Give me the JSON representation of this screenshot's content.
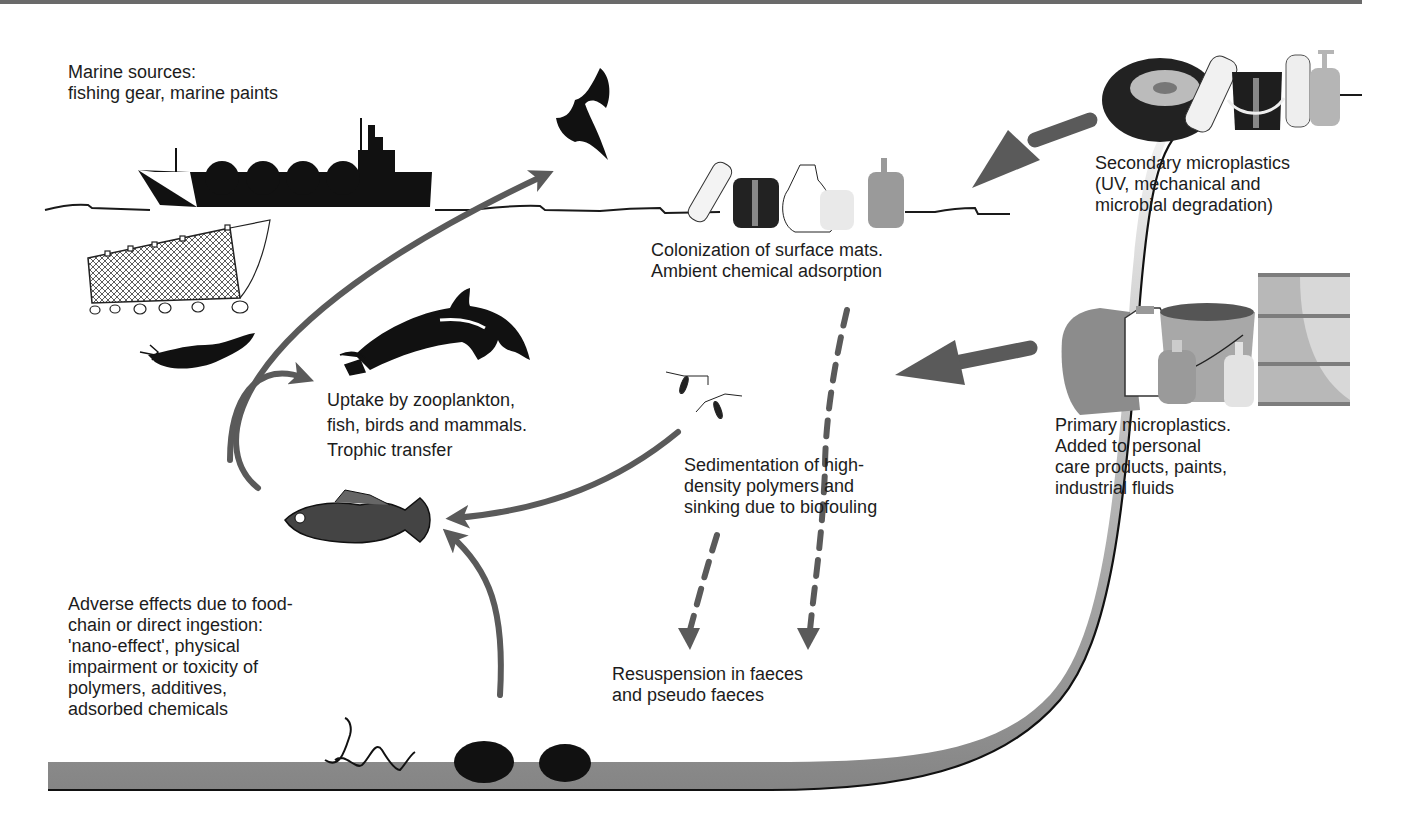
{
  "figure": {
    "labels": {
      "marine_sources": [
        "Marine sources:",
        "fishing gear, marine paints"
      ],
      "colonization": [
        "Colonization of surface mats.",
        "Ambient chemical adsorption"
      ],
      "secondary": [
        "Secondary microplastics",
        "(UV, mechanical and",
        "microbial degradation)"
      ],
      "primary": [
        "Primary microplastics.",
        "Added to personal",
        "care products, paints,",
        "industrial fluids"
      ],
      "uptake": [
        "Uptake by zooplankton,",
        "fish, birds and mammals.",
        "Trophic transfer"
      ],
      "sedimentation": [
        "Sedimentation of high-",
        "density polymers and",
        "sinking due to biofouling"
      ],
      "adverse": [
        "Adverse effects due to food-",
        "chain or direct ingestion:",
        "'nano-effect', physical",
        "impairment or toxicity of",
        "polymers, additives,",
        "adsorbed chemicals"
      ],
      "resuspension": [
        "Resuspension in faeces",
        "and pseudo faeces"
      ]
    },
    "icons": [
      "ship-icon",
      "fishing-net-icon",
      "seal-icon",
      "bird-icon",
      "dolphin-icon",
      "fish-icon",
      "zooplankton-icon",
      "worm-icon",
      "mussel-icon",
      "tyre-icon",
      "bottle-icon",
      "bucket-icon",
      "jerrycan-icon",
      "barrel-icon",
      "soap-dispenser-icon"
    ],
    "colors": {
      "arrow": "#5a5a5a",
      "line": "#1a1a1a",
      "seabed_dark": "#7a7a7a",
      "seabed_light": "#e6e6e6",
      "top_border": "#6a6a6a"
    }
  }
}
